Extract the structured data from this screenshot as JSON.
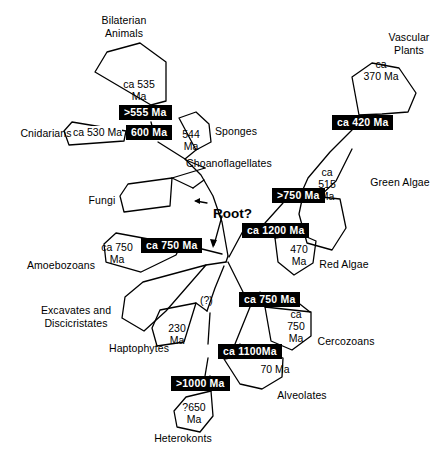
{
  "figure": {
    "root_label": "Root?",
    "uncertainty_marker": "(?)",
    "colors": {
      "background": "#ffffff",
      "line": "#000000",
      "node_box_fill": "#000000",
      "node_box_text": "#ffffff"
    }
  },
  "taxa": [
    {
      "id": "bilaterian-animals",
      "label": "Bilaterian\nAnimals",
      "x": 80,
      "y": 14,
      "w": 88
    },
    {
      "id": "cnidarians",
      "label": "Cnidarians",
      "x": 18,
      "y": 127,
      "w": 56
    },
    {
      "id": "sponges",
      "label": "Sponges",
      "x": 212,
      "y": 125,
      "w": 48
    },
    {
      "id": "choanoflagellates",
      "label": "Choanoflagellates",
      "x": 183,
      "y": 157,
      "w": 92
    },
    {
      "id": "fungi",
      "label": "Fungi",
      "x": 85,
      "y": 194,
      "w": 34
    },
    {
      "id": "amoebozoans",
      "label": "Amoebozoans",
      "x": 23,
      "y": 259,
      "w": 76
    },
    {
      "id": "excavates-discicristates",
      "label": "Excavates and\nDiscicristates",
      "x": 34,
      "y": 304,
      "w": 84
    },
    {
      "id": "haptophytes",
      "label": "Haptophytes",
      "x": 105,
      "y": 342,
      "w": 68
    },
    {
      "id": "heterokonts",
      "label": "Heterokonts",
      "x": 149,
      "y": 432,
      "w": 68
    },
    {
      "id": "alveolates",
      "label": "Alveolates",
      "x": 273,
      "y": 389,
      "w": 58
    },
    {
      "id": "cercozoans",
      "label": "Cercozoans",
      "x": 313,
      "y": 335,
      "w": 66
    },
    {
      "id": "red-algae",
      "label": "Red Algae",
      "x": 315,
      "y": 258,
      "w": 58
    },
    {
      "id": "green-algae",
      "label": "Green Algae",
      "x": 365,
      "y": 176,
      "w": 70
    },
    {
      "id": "vascular-plants",
      "label": "Vascular\nPlants",
      "x": 380,
      "y": 31,
      "w": 58
    }
  ],
  "wedge_ages": [
    {
      "id": "bilaterian-age",
      "label": "ca 535\nMa",
      "x": 113,
      "y": 78,
      "w": 52
    },
    {
      "id": "cnidarian-age",
      "label": "ca 530 Ma",
      "x": 73,
      "y": 126,
      "w": 56,
      "boxed": false
    },
    {
      "id": "sponge-age",
      "label": "544\nMa",
      "x": 177,
      "y": 128,
      "w": 28
    },
    {
      "id": "vascular-plant-age",
      "label": "ca\n370 Ma",
      "x": 358,
      "y": 58,
      "w": 46
    },
    {
      "id": "green-algae-age",
      "label": "ca\n515\nMa",
      "x": 314,
      "y": 166,
      "w": 26
    },
    {
      "id": "red-algae-age",
      "label": "470\nMa",
      "x": 285,
      "y": 243,
      "w": 28
    },
    {
      "id": "cercozoan-age",
      "label": "ca\n750\nMa",
      "x": 283,
      "y": 308,
      "w": 26
    },
    {
      "id": "alveolate-age",
      "label": "70 Ma",
      "x": 257,
      "y": 363,
      "w": 36
    },
    {
      "id": "amoebozoan-age",
      "label": "ca 750\nMa",
      "x": 95,
      "y": 241,
      "w": 44
    },
    {
      "id": "haptophyte-age",
      "label": "230\nMa",
      "x": 163,
      "y": 322,
      "w": 28
    },
    {
      "id": "heterokont-age",
      "label": "?650\nMa",
      "x": 178,
      "y": 401,
      "w": 32
    }
  ],
  "node_ages": [
    {
      "id": "node-555",
      "label": ">555 Ma",
      "x": 119,
      "y": 105
    },
    {
      "id": "node-600",
      "label": "600 Ma",
      "x": 126,
      "y": 125
    },
    {
      "id": "node-420",
      "label": "ca 420 Ma",
      "x": 332,
      "y": 115
    },
    {
      "id": "node-750-right",
      "label": ">750 Ma",
      "x": 272,
      "y": 188
    },
    {
      "id": "node-1200",
      "label": "ca 1200 Ma",
      "x": 242,
      "y": 223
    },
    {
      "id": "node-750-left",
      "label": "ca 750 Ma",
      "x": 141,
      "y": 238
    },
    {
      "id": "node-750-center",
      "label": "ca 750 Ma",
      "x": 239,
      "y": 292
    },
    {
      "id": "node-1100",
      "label": "ca 1100Ma",
      "x": 218,
      "y": 344
    },
    {
      "id": "node-1000",
      "label": ">1000 Ma",
      "x": 171,
      "y": 376
    }
  ],
  "annotations": [
    {
      "id": "root-question",
      "label": "Root?",
      "x": 213,
      "y": 206
    },
    {
      "id": "uncertain-branch",
      "label": "(?)",
      "x": 200,
      "y": 294
    }
  ]
}
